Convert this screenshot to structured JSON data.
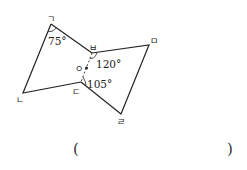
{
  "figure": {
    "vertices": {
      "giyeok": {
        "label": "ㄱ",
        "x": 51,
        "y": 24
      },
      "nieun": {
        "label": "ㄴ",
        "x": 23,
        "y": 93
      },
      "digeut": {
        "label": "ㄷ",
        "x": 81,
        "y": 82
      },
      "rieul": {
        "label": "ㄹ",
        "x": 121,
        "y": 114
      },
      "mieum": {
        "label": "ㅁ",
        "x": 149,
        "y": 45
      },
      "bieup": {
        "label": "ㅂ",
        "x": 92,
        "y": 53
      }
    },
    "center_point": {
      "label": "ㅇ",
      "x": 86,
      "y": 68
    },
    "angles": {
      "at_giyeok": "75°",
      "at_bieup": "120°",
      "at_digeut": "105°"
    },
    "line_color": "#222222"
  },
  "answer_blank": {
    "open": "(",
    "close": ")"
  }
}
